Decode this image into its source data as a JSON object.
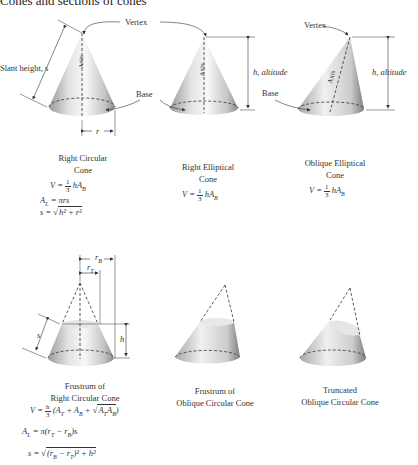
{
  "title": "Cones and sections of cones",
  "labels": {
    "vertex_top": "Vertex",
    "vertex_right": "Vertex",
    "slant_height": "Slant height, s",
    "axis": "Axis",
    "base_mid": "Base",
    "base_right": "Base",
    "altitude_mid": "h, altitude",
    "altitude_right": "h, altitude",
    "r": "r",
    "rB": "r",
    "rB_sub": "B",
    "rT": "r",
    "rT_sub": "T",
    "h": "h",
    "s": "s"
  },
  "figures": [
    {
      "caption_line1": "Right Circular",
      "caption_line2": "Cone",
      "formulas": {
        "volume": {
          "lhs": "V =",
          "num": "1",
          "den": "3",
          "rhs": "hA",
          "sub": "B"
        },
        "lateral": {
          "lhs": "A",
          "lhs_sub": "L",
          "rhs": "= πrs"
        },
        "slant": {
          "lhs": "s =",
          "rad": "h² + r²"
        }
      }
    },
    {
      "caption_line1": "Right Elliptical",
      "caption_line2": "Cone",
      "formulas": {
        "volume": {
          "lhs": "V =",
          "num": "1",
          "den": "3",
          "rhs": "hA",
          "sub": "B"
        }
      }
    },
    {
      "caption_line1": "Oblique Elliptical",
      "caption_line2": "Cone",
      "formulas": {
        "volume": {
          "lhs": "V =",
          "num": "1",
          "den": "3",
          "rhs": "hA",
          "sub": "B"
        }
      }
    },
    {
      "caption_line1": "Frustrum of",
      "caption_line2": "Right Circular Cone",
      "formulas": {
        "volume": {
          "lhs": "V =",
          "num": "h",
          "den": "3",
          "rhs1": "(A",
          "s1": "T",
          "rhs2": " + A",
          "s2": "B",
          "rhs3": " + ",
          "rad1": "A",
          "rs1": "T",
          "rad2": "A",
          "rs2": "B",
          "close": ")"
        },
        "lateral": {
          "lhs": "A",
          "lhs_sub": "L",
          "rhs1": "= π(r",
          "s1": "T",
          "rhs2": " − r",
          "s2": "B",
          "rhs3": ")s"
        },
        "slant": {
          "lhs": "s =",
          "rad1": "(r",
          "s1": "B",
          "rad2": " − r",
          "s2": "T",
          "rad3": ")² + h²"
        }
      }
    },
    {
      "caption_line1": "Frustrum of",
      "caption_line2": "Oblique Circular Cone"
    },
    {
      "caption_line1": "Truncated",
      "caption_line2": "Oblique Circular Cone"
    }
  ]
}
